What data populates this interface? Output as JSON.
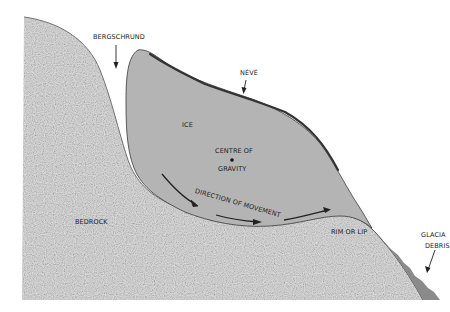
{
  "diagram": {
    "labels": {
      "bergschrund": "BERGSCHRUND",
      "neve": "NÉVÉ",
      "ice": "ICE",
      "centre_of_gravity_line1": "CENTRE OF",
      "centre_of_gravity_line2": "GRAVITY",
      "direction_of_movement": "DIRECTION OF MOVEMENT",
      "bedrock": "BEDROCK",
      "rim_or_lip": "RIM OR LIP",
      "glacial_debris_line1": "GLACIA",
      "glacial_debris_line2": "DEBRIS"
    },
    "colors": {
      "background": "#ffffff",
      "ice_fill": "#b4b4b4",
      "bedrock_fill": "#e2e2e2",
      "bedrock_speckle": "#a8a8a8",
      "debris_fill": "#8a8a8a",
      "outline": "#333333"
    }
  }
}
